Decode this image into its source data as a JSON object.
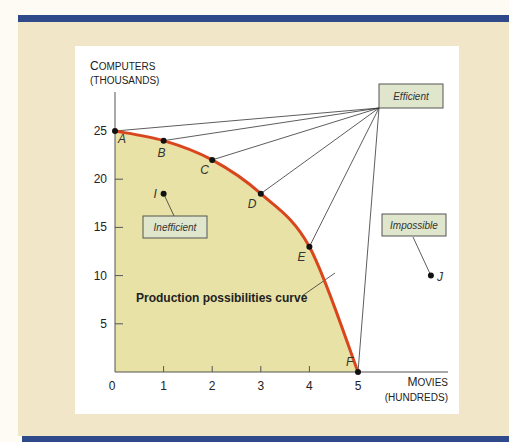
{
  "colors": {
    "frame_blue": "#2f4a8a",
    "background_beige": "#f1e6c8",
    "feasible_fill": "#e8e2a6",
    "curve_red": "#d9461e",
    "callout_box": "#dfe6cc"
  },
  "chart_data": {
    "type": "line",
    "title": "",
    "xlabel": "Movies",
    "xlabel_sub": "(HUNDREDS)",
    "ylabel": "Computers",
    "ylabel_sub": "(THOUSANDS)",
    "xlim": [
      0,
      7
    ],
    "ylim": [
      0,
      28
    ],
    "x_ticks": [
      0,
      1,
      2,
      3,
      4,
      5
    ],
    "y_ticks": [
      5,
      10,
      15,
      20,
      25
    ],
    "grid": false,
    "curve_label": "Production possibilities curve",
    "curve_points": [
      {
        "label": "A",
        "x": 0,
        "y": 25
      },
      {
        "label": "B",
        "x": 1,
        "y": 24
      },
      {
        "label": "C",
        "x": 2,
        "y": 22
      },
      {
        "label": "D",
        "x": 3,
        "y": 18.5
      },
      {
        "label": "E",
        "x": 4,
        "y": 13
      },
      {
        "label": "F",
        "x": 5,
        "y": 0
      }
    ],
    "other_points": [
      {
        "label": "I",
        "x": 1,
        "y": 18.5
      },
      {
        "label": "J",
        "x": 6.5,
        "y": 10
      }
    ],
    "annotations": [
      {
        "text": "Efficient",
        "points_to": [
          "A",
          "B",
          "C",
          "D",
          "E",
          "F"
        ]
      },
      {
        "text": "Inefficient",
        "points_to": [
          "I"
        ]
      },
      {
        "text": "Impossible",
        "points_to": [
          "J"
        ]
      }
    ]
  }
}
